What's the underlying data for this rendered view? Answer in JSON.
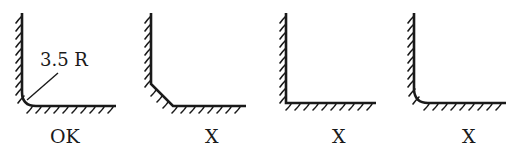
{
  "diagram": {
    "title": "",
    "colors": {
      "stroke": "#1a1a1a",
      "background": "#ffffff"
    },
    "panels": [
      {
        "id": "panel-1",
        "corner_type": "radius-3.5R",
        "verdict": "OK",
        "dimension_label": "3.5 R"
      },
      {
        "id": "panel-2",
        "corner_type": "chamfer",
        "verdict": "X"
      },
      {
        "id": "panel-3",
        "corner_type": "sharp",
        "verdict": "X"
      },
      {
        "id": "panel-4",
        "corner_type": "small-radius",
        "verdict": "X"
      }
    ]
  }
}
